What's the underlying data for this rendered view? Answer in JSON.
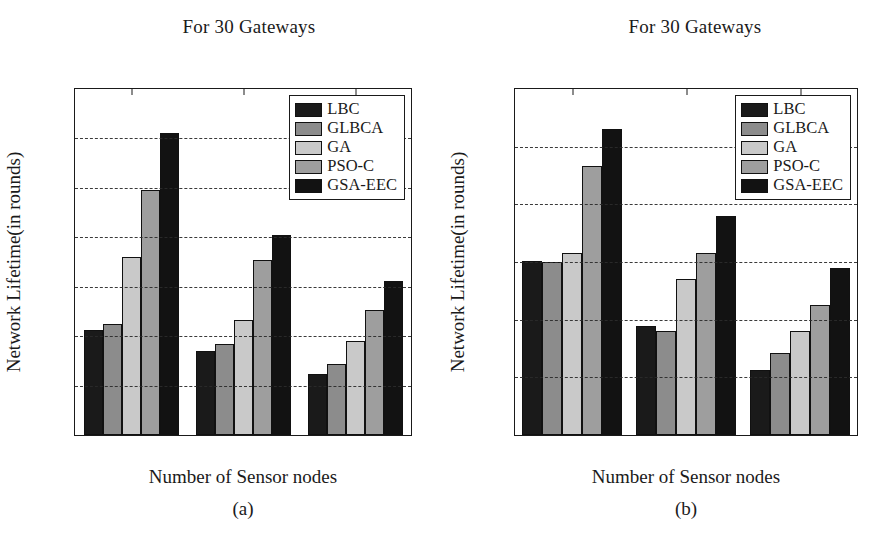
{
  "figure": {
    "background_color": "#ffffff",
    "text_color": "#1a1a1a"
  },
  "series_colors": {
    "LBC": "#1a1a1a",
    "GLBCA": "#8c8c8c",
    "GA": "#c9c9c9",
    "PSO-C": "#9e9e9e",
    "GSA-EEC": "#121212"
  },
  "panels": [
    {
      "id": "a",
      "caption": "(a)",
      "title": "For 30 Gateways",
      "xlabel": "Number of Sensor nodes",
      "ylabel": "Network Lifetime(in rounds)",
      "yticks": [
        "0",
        "100",
        "200",
        "300",
        "400",
        "500",
        "600",
        "700"
      ],
      "xticks": [
        "100",
        "300",
        "500"
      ]
    },
    {
      "id": "b",
      "caption": "(b)",
      "title": "For 30 Gateways",
      "xlabel": "Number of Sensor nodes",
      "ylabel": "Network Lifetime(in rounds)",
      "yticks": [
        "0",
        "100",
        "200",
        "300",
        "400",
        "500",
        "600"
      ],
      "xticks": [
        "100",
        "300",
        "500"
      ]
    }
  ],
  "legend": {
    "position": "top-right-inside",
    "entries": [
      {
        "label": "LBC",
        "color": "#1a1a1a"
      },
      {
        "label": "GLBCA",
        "color": "#8c8c8c"
      },
      {
        "label": "GA",
        "color": "#c9c9c9"
      },
      {
        "label": "PSO-C",
        "color": "#9e9e9e"
      },
      {
        "label": "GSA-EEC",
        "color": "#121212"
      }
    ]
  },
  "chart_data": [
    {
      "type": "bar",
      "panel": "a",
      "title": "For 30 Gateways",
      "xlabel": "Number of Sensor nodes",
      "ylabel": "Network Lifetime(in rounds)",
      "categories": [
        "100",
        "300",
        "500"
      ],
      "ylim": [
        0,
        700
      ],
      "ytick_step": 100,
      "grid": true,
      "legend_position": "upper right",
      "series": [
        {
          "name": "LBC",
          "color": "#1a1a1a",
          "values": [
            212,
            170,
            123
          ]
        },
        {
          "name": "GLBCA",
          "color": "#8c8c8c",
          "values": [
            224,
            185,
            143
          ]
        },
        {
          "name": "GA",
          "color": "#c9c9c9",
          "values": [
            360,
            233,
            190
          ]
        },
        {
          "name": "PSO-C",
          "color": "#9e9e9e",
          "values": [
            496,
            355,
            253
          ]
        },
        {
          "name": "GSA-EEC",
          "color": "#121212",
          "values": [
            611,
            405,
            312
          ]
        }
      ]
    },
    {
      "type": "bar",
      "panel": "b",
      "title": "For 30 Gateways",
      "xlabel": "Number of Sensor nodes",
      "ylabel": "Network Lifetime(in rounds)",
      "categories": [
        "100",
        "300",
        "500"
      ],
      "ylim": [
        0,
        600
      ],
      "ytick_step": 100,
      "grid": true,
      "legend_position": "upper right",
      "series": [
        {
          "name": "LBC",
          "color": "#1a1a1a",
          "values": [
            302,
            189,
            112
          ]
        },
        {
          "name": "GLBCA",
          "color": "#8c8c8c",
          "values": [
            300,
            181,
            142
          ]
        },
        {
          "name": "GA",
          "color": "#c9c9c9",
          "values": [
            315,
            270,
            181
          ]
        },
        {
          "name": "PSO-C",
          "color": "#9e9e9e",
          "values": [
            466,
            316,
            226
          ]
        },
        {
          "name": "GSA-EEC",
          "color": "#121212",
          "values": [
            530,
            380,
            290
          ]
        }
      ]
    }
  ]
}
